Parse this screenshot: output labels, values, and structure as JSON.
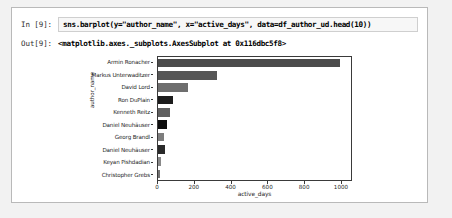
{
  "notebook": {
    "input_prompt": "In [9]:",
    "input_code": "sns.barplot(y=\"author_name\", x=\"active_days\", data=df_author_ud.head(10))",
    "output_prompt": "Out[9]:",
    "output_text": "<matplotlib.axes._subplots.AxesSubplot at 0x116dbc5f8>"
  },
  "chart_data": {
    "type": "bar",
    "orientation": "horizontal",
    "title": "",
    "xlabel": "active_days",
    "ylabel": "author_name",
    "xlim": [
      0,
      1060
    ],
    "xticks": [
      0,
      200,
      400,
      600,
      800,
      1000
    ],
    "xtick_labels": [
      "0",
      "200",
      "400",
      "600",
      "800",
      "1000"
    ],
    "grid": false,
    "legend": "none",
    "categories": [
      "Armin Ronacher",
      "Markus Unterwaditzer",
      "David Lord",
      "Ron DuPlain",
      "Kenneth Reitz",
      "Daniel Neuhäuser",
      "Georg Brandl",
      "Daniel Neuhäuser",
      "Keyan Pishdadian",
      "Christopher Grebs"
    ],
    "values": [
      1000,
      325,
      165,
      82,
      64,
      50,
      34,
      36,
      14,
      10
    ],
    "bar_colors": [
      "#4c4c4c",
      "#565656",
      "#6e6e6e",
      "#1c1c1c",
      "#606060",
      "#0d0d0d",
      "#7d7d7d",
      "#2a2a2a",
      "#898989",
      "#737373"
    ]
  }
}
